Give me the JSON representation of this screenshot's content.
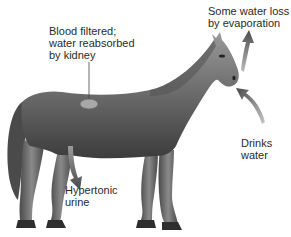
{
  "diagram": {
    "colors": {
      "background": "#ffffff",
      "body_dark": "#3c3c3c",
      "body_mid": "#6e6e6e",
      "body_light": "#a8a8a8",
      "arrow": "#555555",
      "leader_line": "#444444",
      "text": "#2a2a2a"
    },
    "labels": {
      "kidney": {
        "lines": [
          "Blood filtered;",
          "water reabsorbed",
          "by kidney"
        ]
      },
      "evaporation": {
        "lines": [
          "Some water loss",
          "by evaporation"
        ]
      },
      "drinking": {
        "lines": [
          "Drinks",
          "water"
        ]
      },
      "urine": {
        "lines": [
          "Hypertonic",
          "urine"
        ]
      }
    },
    "arrows": [
      {
        "name": "evaporation-arrow",
        "direction": "up",
        "from": "muzzle"
      },
      {
        "name": "drinking-arrow",
        "direction": "in",
        "to": "mouth"
      },
      {
        "name": "urine-arrow",
        "direction": "down",
        "from": "belly"
      }
    ],
    "leader_lines": [
      {
        "name": "kidney-leader-line",
        "to": "kidney"
      }
    ]
  }
}
